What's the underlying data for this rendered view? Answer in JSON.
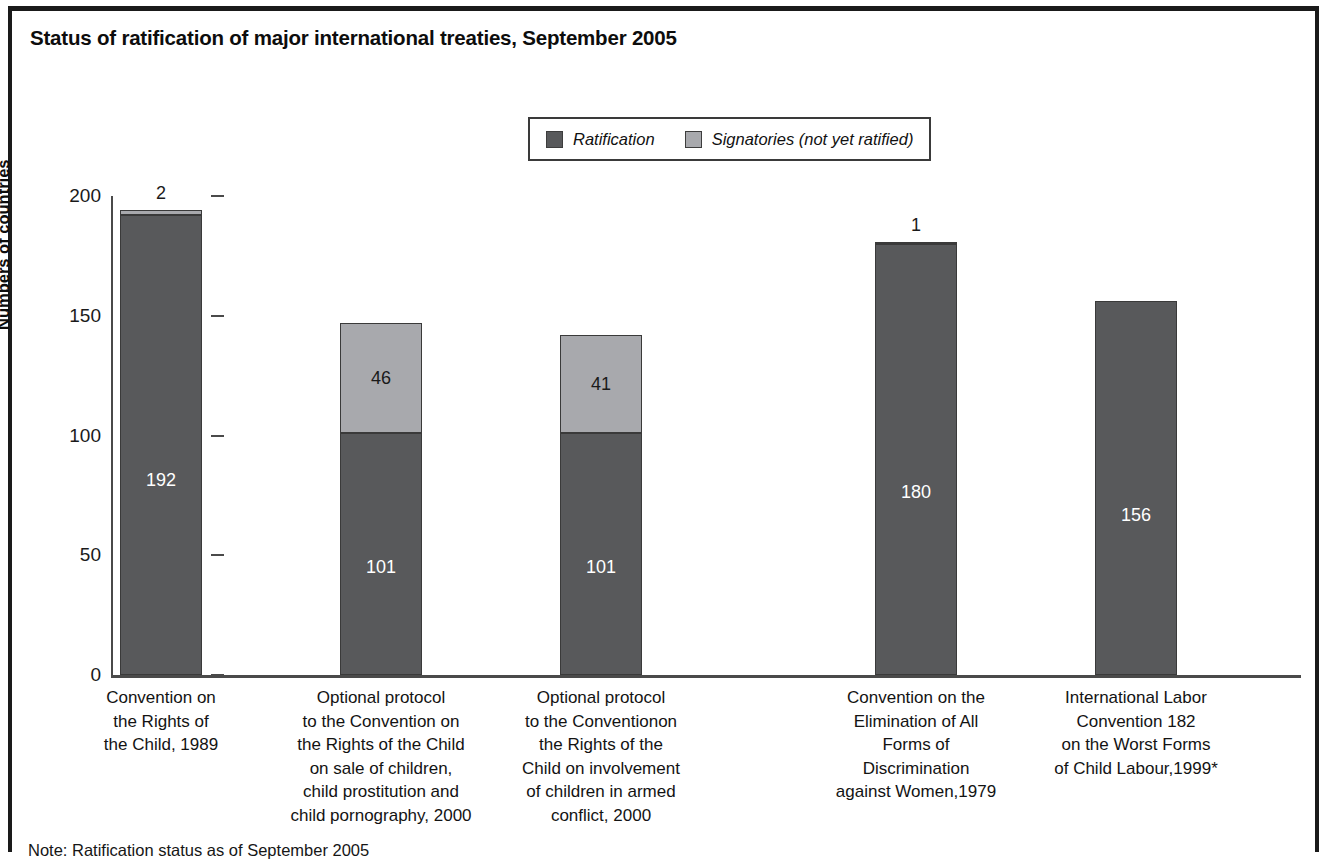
{
  "title": "Status of ratification of major international treaties, September 2005",
  "footnote": "Note: Ratification status as of September 2005",
  "legend": {
    "items": [
      {
        "label": "Ratification",
        "color": "#58595b"
      },
      {
        "label": "Signatories (not yet ratified)",
        "color": "#a8a9ad"
      }
    ]
  },
  "axes": {
    "ylabel": "Numbers of countries",
    "yticks": [
      "0",
      "50",
      "100",
      "150",
      "200"
    ]
  },
  "chart_data": {
    "type": "bar",
    "title": "Status of ratification of major international treaties, September 2005",
    "xlabel": "",
    "ylabel": "Numbers of countries",
    "ylim": [
      0,
      200
    ],
    "ytick_values": [
      0,
      50,
      100,
      150,
      200
    ],
    "grid": false,
    "stacked": true,
    "legend_position": "top-center",
    "categories": [
      "Convention on the Rights of the Child, 1989",
      "Optional protocol to the Convention on the Rights of the Child on sale of children, child prostitution and child pornography, 2000",
      "Optional protocol to the Conventionon the Rights of the Child on involvement of children in armed conflict, 2000",
      "Convention on the Elimination of All Forms of Discrimination against Women,1979",
      "International Labor Convention 182 on the Worst Forms of Child Labour,1999*"
    ],
    "category_lines": [
      [
        "Convention on",
        "the Rights of",
        "the Child, 1989"
      ],
      [
        "Optional protocol",
        "to the Convention on",
        "the Rights of the Child",
        "on sale of children,",
        "child prostitution and",
        "child pornography, 2000"
      ],
      [
        "Optional protocol",
        "to the Conventionon",
        "the Rights of the",
        "Child on involvement",
        "of children in armed",
        "conflict, 2000"
      ],
      [
        "Convention on the",
        "Elimination of All",
        "Forms of",
        "Discrimination",
        "against Women,1979"
      ],
      [
        "International Labor",
        "Convention 182",
        "on the Worst Forms",
        "of Child Labour,1999*"
      ]
    ],
    "series": [
      {
        "name": "Ratification",
        "color": "#58595b",
        "values": [
          192,
          101,
          101,
          180,
          156
        ]
      },
      {
        "name": "Signatories (not yet ratified)",
        "color": "#a8a9ad",
        "values": [
          2,
          46,
          41,
          1,
          0
        ]
      }
    ],
    "totals": [
      194,
      147,
      142,
      181,
      156
    ]
  },
  "bars": [
    {
      "name": "bar-convention-rights-child-1989",
      "ratification": 192,
      "signatories": 2,
      "ratification_label": "192",
      "signatories_label": "2",
      "signatories_label_placement": "above"
    },
    {
      "name": "bar-optional-protocol-sale-of-children-2000",
      "ratification": 101,
      "signatories": 46,
      "ratification_label": "101",
      "signatories_label": "46",
      "signatories_label_placement": "inside"
    },
    {
      "name": "bar-optional-protocol-armed-conflict-2000",
      "ratification": 101,
      "signatories": 41,
      "ratification_label": "101",
      "signatories_label": "41",
      "signatories_label_placement": "inside"
    },
    {
      "name": "bar-cedaw-1979",
      "ratification": 180,
      "signatories": 1,
      "ratification_label": "180",
      "signatories_label": "1",
      "signatories_label_placement": "above"
    },
    {
      "name": "bar-ilo-convention-182-1999",
      "ratification": 156,
      "signatories": 0,
      "ratification_label": "156",
      "signatories_label": "",
      "signatories_label_placement": "none"
    }
  ]
}
